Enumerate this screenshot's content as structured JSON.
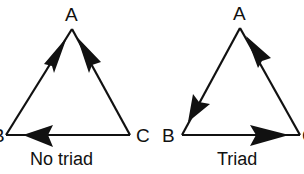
{
  "diagrams": [
    {
      "caption": "No triad",
      "vertices": {
        "A": "A",
        "B": "B",
        "C": "C"
      },
      "edges": [
        {
          "from": "B",
          "to": "A"
        },
        {
          "from": "C",
          "to": "A"
        },
        {
          "from": "C",
          "to": "B"
        }
      ]
    },
    {
      "caption": "Triad",
      "vertices": {
        "A": "A",
        "B": "B",
        "C": "C"
      },
      "edges": [
        {
          "from": "A",
          "to": "B"
        },
        {
          "from": "C",
          "to": "A"
        },
        {
          "from": "B",
          "to": "C"
        }
      ]
    }
  ],
  "colors": {
    "line": "#111111",
    "background": "#ffffff"
  }
}
